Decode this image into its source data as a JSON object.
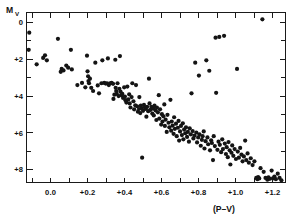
{
  "figure": {
    "title": "",
    "background_color": "#ffffff",
    "ink_color": "#141414"
  },
  "chart_data": {
    "type": "scatter",
    "title": "",
    "subtitle": "",
    "xlabel": "(P–V)",
    "ylabel": "M",
    "ylabel_subscript": "V",
    "xlim": [
      -0.13,
      1.27
    ],
    "ylim": [
      8.7,
      -0.55
    ],
    "y_inverted": true,
    "grid": false,
    "legend": null,
    "legend_position": "none",
    "marker": "filled-circle",
    "marker_size_px": 2.1,
    "xticks": [
      -0.2,
      -0.1,
      0.0,
      0.1,
      0.2,
      0.3,
      0.4,
      0.5,
      0.6,
      0.7,
      0.8,
      0.9,
      1.0,
      1.1,
      1.2
    ],
    "xticklabels": [
      "",
      "",
      "0.0",
      "",
      "+0.2",
      "",
      "+0.4",
      "",
      "+0.6",
      "",
      "+0.8",
      "",
      "+1.0",
      "",
      "+1.2"
    ],
    "xtick_labeled_values": [
      0.0,
      0.2,
      0.4,
      0.6,
      0.8,
      1.0,
      1.2
    ],
    "xtick_labeled_text": [
      "0.0",
      "+0.2",
      "+0.4",
      "+0.6",
      "+0.8",
      "+1.0",
      "+1.2"
    ],
    "yticks": [
      0,
      1,
      2,
      3,
      4,
      5,
      6,
      7,
      8
    ],
    "yticklabels": [
      "0",
      "",
      "+2",
      "",
      "+4",
      "",
      "+6",
      "",
      "+8"
    ],
    "ytick_labeled_values": [
      0,
      2,
      4,
      6,
      8
    ],
    "ytick_labeled_text": [
      "0",
      "+2",
      "+4",
      "+6",
      "+8"
    ],
    "n_points": 201,
    "points": [
      [
        -0.115,
        0.55
      ],
      [
        -0.118,
        1.48
      ],
      [
        -0.075,
        2.27
      ],
      [
        -0.04,
        1.92
      ],
      [
        -0.03,
        1.78
      ],
      [
        -0.02,
        2.05
      ],
      [
        0.04,
        0.88
      ],
      [
        0.055,
        2.68
      ],
      [
        0.06,
        2.52
      ],
      [
        0.07,
        2.6
      ],
      [
        0.085,
        2.34
      ],
      [
        0.095,
        2.45
      ],
      [
        0.11,
        1.48
      ],
      [
        0.115,
        2.55
      ],
      [
        0.145,
        3.4
      ],
      [
        0.17,
        3.28
      ],
      [
        0.188,
        3.52
      ],
      [
        0.197,
        1.8
      ],
      [
        0.2,
        2.65
      ],
      [
        0.203,
        2.92
      ],
      [
        0.205,
        3.18
      ],
      [
        0.208,
        3.3
      ],
      [
        0.213,
        3.05
      ],
      [
        0.22,
        3.55
      ],
      [
        0.23,
        3.72
      ],
      [
        0.242,
        2.18
      ],
      [
        0.255,
        3.42
      ],
      [
        0.262,
        3.85
      ],
      [
        0.275,
        3.3
      ],
      [
        0.28,
        2.05
      ],
      [
        0.29,
        3.28
      ],
      [
        0.298,
        3.32
      ],
      [
        0.305,
        3.3
      ],
      [
        0.31,
        1.95
      ],
      [
        0.315,
        3.4
      ],
      [
        0.322,
        3.3
      ],
      [
        0.33,
        3.28
      ],
      [
        0.338,
        3.33
      ],
      [
        0.34,
        4.15
      ],
      [
        0.345,
        3.92
      ],
      [
        0.35,
        2.02
      ],
      [
        0.352,
        3.55
      ],
      [
        0.355,
        3.72
      ],
      [
        0.358,
        3.88
      ],
      [
        0.362,
        3.3
      ],
      [
        0.368,
        4.0
      ],
      [
        0.372,
        3.6
      ],
      [
        0.375,
        1.82
      ],
      [
        0.378,
        3.75
      ],
      [
        0.382,
        3.95
      ],
      [
        0.388,
        3.88
      ],
      [
        0.392,
        4.1
      ],
      [
        0.398,
        3.52
      ],
      [
        0.402,
        4.02
      ],
      [
        0.405,
        4.22
      ],
      [
        0.41,
        4.35
      ],
      [
        0.415,
        3.48
      ],
      [
        0.42,
        4.18
      ],
      [
        0.425,
        3.9
      ],
      [
        0.428,
        4.4
      ],
      [
        0.432,
        4.62
      ],
      [
        0.438,
        4.05
      ],
      [
        0.442,
        3.3
      ],
      [
        0.448,
        4.28
      ],
      [
        0.452,
        4.72
      ],
      [
        0.458,
        4.5
      ],
      [
        0.462,
        3.4
      ],
      [
        0.468,
        4.55
      ],
      [
        0.472,
        4.85
      ],
      [
        0.478,
        4.7
      ],
      [
        0.48,
        4.05
      ],
      [
        0.485,
        4.92
      ],
      [
        0.488,
        4.52
      ],
      [
        0.492,
        4.65
      ],
      [
        0.495,
        7.35
      ],
      [
        0.5,
        4.8
      ],
      [
        0.505,
        4.48
      ],
      [
        0.51,
        4.62
      ],
      [
        0.515,
        4.7
      ],
      [
        0.518,
        5.12
      ],
      [
        0.522,
        4.58
      ],
      [
        0.528,
        4.82
      ],
      [
        0.532,
        3.05
      ],
      [
        0.535,
        4.4
      ],
      [
        0.54,
        4.75
      ],
      [
        0.545,
        4.58
      ],
      [
        0.55,
        4.95
      ],
      [
        0.555,
        4.68
      ],
      [
        0.558,
        5.05
      ],
      [
        0.562,
        4.52
      ],
      [
        0.568,
        4.78
      ],
      [
        0.572,
        5.3
      ],
      [
        0.575,
        4.62
      ],
      [
        0.58,
        4.88
      ],
      [
        0.585,
        3.95
      ],
      [
        0.588,
        5.22
      ],
      [
        0.592,
        4.72
      ],
      [
        0.598,
        5.55
      ],
      [
        0.602,
        4.98
      ],
      [
        0.605,
        5.38
      ],
      [
        0.61,
        5.1
      ],
      [
        0.615,
        4.45
      ],
      [
        0.618,
        5.62
      ],
      [
        0.622,
        5.28
      ],
      [
        0.628,
        5.95
      ],
      [
        0.632,
        5.02
      ],
      [
        0.638,
        5.45
      ],
      [
        0.642,
        5.7
      ],
      [
        0.648,
        4.2
      ],
      [
        0.652,
        5.88
      ],
      [
        0.655,
        5.38
      ],
      [
        0.66,
        5.6
      ],
      [
        0.665,
        6.05
      ],
      [
        0.668,
        5.15
      ],
      [
        0.672,
        5.78
      ],
      [
        0.678,
        5.5
      ],
      [
        0.682,
        6.18
      ],
      [
        0.688,
        5.72
      ],
      [
        0.692,
        5.35
      ],
      [
        0.695,
        6.42
      ],
      [
        0.7,
        5.92
      ],
      [
        0.705,
        5.62
      ],
      [
        0.71,
        6.12
      ],
      [
        0.715,
        5.48
      ],
      [
        0.718,
        6.35
      ],
      [
        0.722,
        5.82
      ],
      [
        0.728,
        6.02
      ],
      [
        0.732,
        5.7
      ],
      [
        0.738,
        6.22
      ],
      [
        0.742,
        5.95
      ],
      [
        0.748,
        6.48
      ],
      [
        0.752,
        5.75
      ],
      [
        0.758,
        6.08
      ],
      [
        0.762,
        3.85
      ],
      [
        0.768,
        5.9
      ],
      [
        0.772,
        6.3
      ],
      [
        0.778,
        6.15
      ],
      [
        0.782,
        2.18
      ],
      [
        0.788,
        5.98
      ],
      [
        0.792,
        6.52
      ],
      [
        0.798,
        6.25
      ],
      [
        0.802,
        2.88
      ],
      [
        0.805,
        6.08
      ],
      [
        0.812,
        6.7
      ],
      [
        0.818,
        6.38
      ],
      [
        0.822,
        6.18
      ],
      [
        0.828,
        5.92
      ],
      [
        0.832,
        6.85
      ],
      [
        0.838,
        6.45
      ],
      [
        0.842,
        2.05
      ],
      [
        0.848,
        6.25
      ],
      [
        0.852,
        6.62
      ],
      [
        0.858,
        2.62
      ],
      [
        0.862,
        6.95
      ],
      [
        0.868,
        6.4
      ],
      [
        0.872,
        6.55
      ],
      [
        0.878,
        7.48
      ],
      [
        0.882,
        6.18
      ],
      [
        0.888,
        6.72
      ],
      [
        0.892,
        0.82
      ],
      [
        0.895,
        3.82
      ],
      [
        0.902,
        6.92
      ],
      [
        0.908,
        6.48
      ],
      [
        0.912,
        0.78
      ],
      [
        0.915,
        6.65
      ],
      [
        0.922,
        7.05
      ],
      [
        0.928,
        6.35
      ],
      [
        0.932,
        6.88
      ],
      [
        0.938,
        0.72
      ],
      [
        0.942,
        6.58
      ],
      [
        0.948,
        7.15
      ],
      [
        0.952,
        6.78
      ],
      [
        0.958,
        7.32
      ],
      [
        0.962,
        6.5
      ],
      [
        0.968,
        6.95
      ],
      [
        0.972,
        7.72
      ],
      [
        0.978,
        7.08
      ],
      [
        0.982,
        6.68
      ],
      [
        0.988,
        7.25
      ],
      [
        0.995,
        6.88
      ],
      [
        1.002,
        7.42
      ],
      [
        1.008,
        2.52
      ],
      [
        1.012,
        7.02
      ],
      [
        1.018,
        7.35
      ],
      [
        1.025,
        6.82
      ],
      [
        1.032,
        7.18
      ],
      [
        1.038,
        7.55
      ],
      [
        1.045,
        7.28
      ],
      [
        1.052,
        6.42
      ],
      [
        1.058,
        7.48
      ],
      [
        1.065,
        7.12
      ],
      [
        1.072,
        7.62
      ],
      [
        1.082,
        7.38
      ],
      [
        1.092,
        7.75
      ],
      [
        1.102,
        7.55
      ],
      [
        1.112,
        8.45
      ],
      [
        1.118,
        8.52
      ],
      [
        1.122,
        8.4
      ],
      [
        1.128,
        8.48
      ],
      [
        1.135,
        7.92
      ],
      [
        1.145,
        -0.18
      ],
      [
        1.152,
        8.12
      ],
      [
        1.162,
        8.45
      ],
      [
        1.172,
        8.55
      ],
      [
        1.178,
        8.42
      ],
      [
        1.185,
        8.5
      ],
      [
        1.195,
        8.05
      ],
      [
        1.202,
        8.48
      ],
      [
        1.21,
        8.38
      ],
      [
        1.218,
        8.52
      ],
      [
        1.228,
        8.22
      ],
      [
        1.238,
        8.45
      ],
      [
        1.248,
        8.58
      ]
    ]
  }
}
